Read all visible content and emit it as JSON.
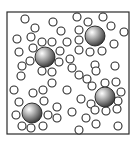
{
  "diagram": {
    "type": "particle-box",
    "background": "#ffffff",
    "box": {
      "x": 7,
      "y": 12,
      "width": 122,
      "height": 122,
      "stroke": "#2a2a2a",
      "stroke_width": 1.2
    },
    "small_particle_style": {
      "r": 4,
      "stroke": "#2b2b2b",
      "stroke_width": 1.1,
      "fill": "#ffffff"
    },
    "large_sphere_style": {
      "r": 10,
      "outline": "#1e1e1e",
      "highlight": "#ffffff",
      "mid": "#a8a8a8",
      "shadow": "#3c3c3c"
    },
    "large_spheres": [
      {
        "id": "sphere-1",
        "cx": 45,
        "cy": 57
      },
      {
        "id": "sphere-2",
        "cx": 95,
        "cy": 36
      },
      {
        "id": "sphere-3",
        "cx": 105,
        "cy": 97
      },
      {
        "id": "sphere-4",
        "cx": 32,
        "cy": 113
      }
    ],
    "small_particles": [
      [
        25,
        19
      ],
      [
        53,
        22
      ],
      [
        77,
        17
      ],
      [
        103,
        17
      ],
      [
        35,
        28
      ],
      [
        61,
        31
      ],
      [
        88,
        22
      ],
      [
        111,
        26
      ],
      [
        124,
        32
      ],
      [
        17,
        39
      ],
      [
        31,
        37
      ],
      [
        42,
        42
      ],
      [
        52,
        42
      ],
      [
        79,
        30
      ],
      [
        79,
        40
      ],
      [
        67,
        42
      ],
      [
        114,
        44
      ],
      [
        19,
        52
      ],
      [
        33,
        48
      ],
      [
        60,
        51
      ],
      [
        79,
        50
      ],
      [
        90,
        52
      ],
      [
        102,
        51
      ],
      [
        30,
        61
      ],
      [
        22,
        66
      ],
      [
        59,
        62
      ],
      [
        70,
        59
      ],
      [
        72,
        68
      ],
      [
        95,
        65
      ],
      [
        115,
        66
      ],
      [
        21,
        76
      ],
      [
        42,
        71
      ],
      [
        52,
        72
      ],
      [
        79,
        75
      ],
      [
        87,
        79
      ],
      [
        96,
        71
      ],
      [
        116,
        82
      ],
      [
        14,
        90
      ],
      [
        52,
        83
      ],
      [
        67,
        90
      ],
      [
        33,
        93
      ],
      [
        43,
        90
      ],
      [
        92,
        86
      ],
      [
        105,
        83
      ],
      [
        121,
        92
      ],
      [
        19,
        102
      ],
      [
        44,
        101
      ],
      [
        81,
        99
      ],
      [
        91,
        104
      ],
      [
        118,
        101
      ],
      [
        16,
        115
      ],
      [
        48,
        115
      ],
      [
        57,
        107
      ],
      [
        72,
        112
      ],
      [
        95,
        110
      ],
      [
        106,
        111
      ],
      [
        117,
        109
      ],
      [
        22,
        126
      ],
      [
        31,
        128
      ],
      [
        43,
        126
      ],
      [
        57,
        118
      ],
      [
        86,
        118
      ],
      [
        79,
        130
      ],
      [
        96,
        124
      ],
      [
        118,
        126
      ]
    ]
  }
}
